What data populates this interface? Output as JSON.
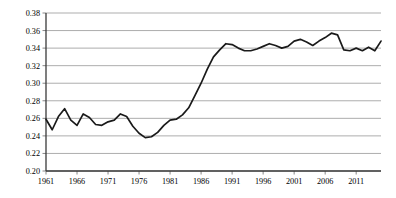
{
  "chart_data": {
    "type": "line",
    "title": "",
    "subtitle": "",
    "xlabel": "",
    "ylabel": "",
    "xlim": [
      1961,
      2015
    ],
    "ylim": [
      0.2,
      0.38
    ],
    "grid": true,
    "grid_orientation": "horizontal",
    "legend": false,
    "legend_position": "none",
    "y_ticks": [
      0.2,
      0.22,
      0.24,
      0.26,
      0.28,
      0.3,
      0.32,
      0.34,
      0.36,
      0.38
    ],
    "y_tick_labels": [
      "0.20",
      "0.22",
      "0.24",
      "0.26",
      "0.28",
      "0.30",
      "0.32",
      "0.34",
      "0.36",
      "0.38"
    ],
    "x_ticks": [
      1961,
      1966,
      1971,
      1976,
      1981,
      1986,
      1991,
      1996,
      2001,
      2006,
      2011
    ],
    "x_tick_labels": [
      "1961",
      "1966",
      "1971",
      "1976",
      "1981",
      "1986",
      "1991",
      "1996",
      "2001",
      "2006",
      "2011"
    ],
    "line_color": "#1a1a1a",
    "grid_color": "#8a8a8a",
    "axis_color": "#3a3a3a",
    "series": [
      {
        "name": "series-1",
        "x": [
          1961,
          1962,
          1963,
          1964,
          1965,
          1966,
          1967,
          1968,
          1969,
          1970,
          1971,
          1972,
          1973,
          1974,
          1975,
          1976,
          1977,
          1978,
          1979,
          1980,
          1981,
          1982,
          1983,
          1984,
          1985,
          1986,
          1987,
          1988,
          1989,
          1990,
          1991,
          1992,
          1993,
          1994,
          1995,
          1996,
          1997,
          1998,
          1999,
          2000,
          2001,
          2002,
          2003,
          2004,
          2005,
          2006,
          2007,
          2008,
          2009,
          2010,
          2011,
          2012,
          2013,
          2014,
          2015
        ],
        "y": [
          0.259,
          0.247,
          0.262,
          0.271,
          0.258,
          0.252,
          0.265,
          0.261,
          0.253,
          0.252,
          0.256,
          0.258,
          0.265,
          0.262,
          0.251,
          0.243,
          0.238,
          0.239,
          0.244,
          0.252,
          0.258,
          0.259,
          0.264,
          0.272,
          0.286,
          0.3,
          0.316,
          0.33,
          0.338,
          0.345,
          0.344,
          0.34,
          0.337,
          0.337,
          0.339,
          0.342,
          0.345,
          0.343,
          0.34,
          0.342,
          0.348,
          0.35,
          0.347,
          0.343,
          0.348,
          0.352,
          0.357,
          0.355,
          0.338,
          0.337,
          0.34,
          0.337,
          0.341,
          0.337,
          0.348
        ]
      }
    ]
  },
  "axes": {
    "y_axis_name": "y-axis",
    "x_axis_name": "x-axis"
  }
}
